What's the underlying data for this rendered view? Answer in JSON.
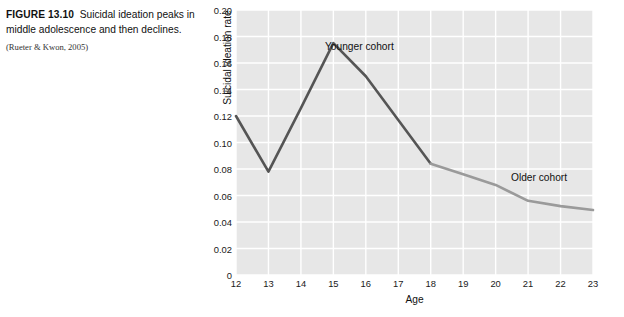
{
  "caption": {
    "figure_number": "FIGURE 13.10",
    "title": "Suicidal ideation peaks in middle adolescence and then declines.",
    "source": "(Rueter & Kwon, 2005)"
  },
  "chart_data": {
    "type": "line",
    "title": "",
    "xlabel": "Age",
    "ylabel": "Suicidal ideation rate",
    "xlim": [
      12,
      23
    ],
    "ylim": [
      0,
      0.2
    ],
    "grid": true,
    "legend_position": "inline-annotation",
    "x_ticks": [
      "12",
      "13",
      "14",
      "15",
      "16",
      "17",
      "18",
      "19",
      "20",
      "21",
      "22",
      "23"
    ],
    "y_ticks": [
      "0",
      "0.02",
      "0.04",
      "0.06",
      "0.08",
      "0.10",
      "0.12",
      "0.14",
      "0.16",
      "0.18",
      "0.20"
    ],
    "x": [
      12,
      13,
      14,
      15,
      16,
      17,
      18,
      19,
      20,
      21,
      22,
      23
    ],
    "series": [
      {
        "name": "Younger cohort",
        "color": "#555555",
        "x": [
          12,
          13,
          14,
          15,
          16,
          17,
          18
        ],
        "values": [
          0.12,
          0.078,
          0.126,
          0.175,
          0.15,
          0.117,
          0.084
        ]
      },
      {
        "name": "Older cohort",
        "color": "#9a9a9a",
        "x": [
          18,
          19,
          20,
          21,
          22,
          23
        ],
        "values": [
          0.084,
          0.076,
          0.068,
          0.056,
          0.052,
          0.049
        ]
      }
    ],
    "annotations": [
      {
        "text": "Younger cohort",
        "near_x": 15,
        "near_y": 0.185
      },
      {
        "text": "Older cohort",
        "near_x": 20.6,
        "near_y": 0.078
      }
    ],
    "colors": {
      "plot_background": "#e7e7e7",
      "gridlines": "#ffffff",
      "page_background": "#ffffff"
    }
  }
}
